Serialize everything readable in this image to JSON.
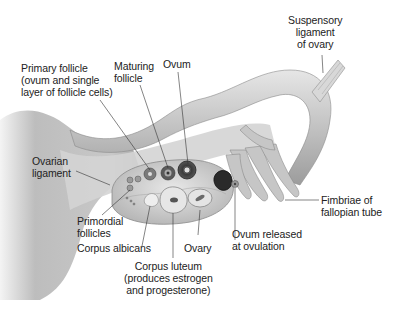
{
  "diagram": {
    "colors": {
      "background": "#ffffff",
      "tissue": "#c9c9c9",
      "tissue_dark": "#9a9a9a",
      "label_text": "#222222",
      "leader_line": "#333333"
    },
    "labels": {
      "suspensory_ligament": "Suspensory\nligament\nof ovary",
      "primary_follicle": "Primary follicle\n(ovum and single\nlayer of follicle cells)",
      "maturing_follicle": "Maturing\nfollicle",
      "ovum": "Ovum",
      "ovarian_ligament": "Ovarian\nligament",
      "primordial_follicles": "Primordial\nfollicles",
      "corpus_albicans": "Corpus albicans",
      "ovary": "Ovary",
      "corpus_luteum": "Corpus luteum\n(produces estrogen\nand progesterone)",
      "ovum_released": "Ovum released\nat ovulation",
      "fimbriae": "Fimbriae of\nfallopian tube"
    }
  }
}
